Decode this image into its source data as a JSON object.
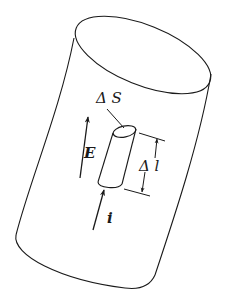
{
  "diagram": {
    "type": "physics-illustration",
    "labels": {
      "delta_s": "Δ S",
      "delta_l": "Δ l",
      "field": "E",
      "current": "i"
    },
    "colors": {
      "stroke": "#1a1a1a",
      "background": "#ffffff"
    }
  }
}
